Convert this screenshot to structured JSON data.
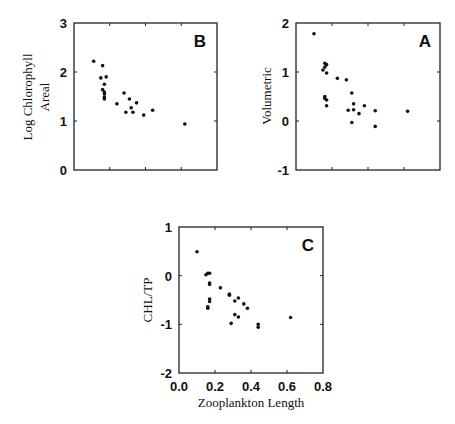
{
  "chart_data": [
    {
      "type": "scatter",
      "panel_label": "B",
      "title": "",
      "xlabel": "",
      "ylabel": "Log Chlorophyll Areal",
      "ylabel_lines": [
        "Log Chlorophyll",
        "Areal"
      ],
      "xlim": [
        0,
        0.8
      ],
      "ylim": [
        0,
        3
      ],
      "xticks": [
        0.0,
        0.2,
        0.4,
        0.6,
        0.8
      ],
      "xtick_labels_shown": false,
      "yticks": [
        0,
        1,
        2,
        3
      ],
      "ytick_labels": [
        "0",
        "1",
        "2",
        "3"
      ],
      "grid": false,
      "points": [
        {
          "x": 0.11,
          "y": 2.22
        },
        {
          "x": 0.16,
          "y": 2.13
        },
        {
          "x": 0.15,
          "y": 1.88
        },
        {
          "x": 0.18,
          "y": 1.9
        },
        {
          "x": 0.17,
          "y": 1.75
        },
        {
          "x": 0.16,
          "y": 1.64
        },
        {
          "x": 0.17,
          "y": 1.59
        },
        {
          "x": 0.17,
          "y": 1.55
        },
        {
          "x": 0.17,
          "y": 1.49
        },
        {
          "x": 0.17,
          "y": 1.45
        },
        {
          "x": 0.24,
          "y": 1.35
        },
        {
          "x": 0.28,
          "y": 1.57
        },
        {
          "x": 0.31,
          "y": 1.45
        },
        {
          "x": 0.35,
          "y": 1.37
        },
        {
          "x": 0.29,
          "y": 1.18
        },
        {
          "x": 0.32,
          "y": 1.27
        },
        {
          "x": 0.33,
          "y": 1.18
        },
        {
          "x": 0.39,
          "y": 1.12
        },
        {
          "x": 0.44,
          "y": 1.22
        },
        {
          "x": 0.62,
          "y": 0.94
        }
      ]
    },
    {
      "type": "scatter",
      "panel_label": "A",
      "title": "",
      "xlabel": "",
      "ylabel": "Volumetric",
      "ylabel_lines": [
        "Volumetric"
      ],
      "xlim": [
        0,
        0.8
      ],
      "ylim": [
        -1,
        2
      ],
      "xticks": [
        0.0,
        0.2,
        0.4,
        0.6,
        0.8
      ],
      "xtick_labels_shown": false,
      "yticks": [
        -1,
        0,
        1,
        2
      ],
      "ytick_labels": [
        "-1",
        "0",
        "1",
        "2"
      ],
      "grid": false,
      "points": [
        {
          "x": 0.1,
          "y": 1.78
        },
        {
          "x": 0.16,
          "y": 1.18
        },
        {
          "x": 0.17,
          "y": 1.15
        },
        {
          "x": 0.15,
          "y": 1.04
        },
        {
          "x": 0.17,
          "y": 0.98
        },
        {
          "x": 0.16,
          "y": 1.1
        },
        {
          "x": 0.16,
          "y": 0.5
        },
        {
          "x": 0.16,
          "y": 0.46
        },
        {
          "x": 0.17,
          "y": 0.43
        },
        {
          "x": 0.17,
          "y": 0.31
        },
        {
          "x": 0.23,
          "y": 0.87
        },
        {
          "x": 0.28,
          "y": 0.84
        },
        {
          "x": 0.31,
          "y": 0.57
        },
        {
          "x": 0.32,
          "y": 0.35
        },
        {
          "x": 0.29,
          "y": 0.22
        },
        {
          "x": 0.32,
          "y": 0.23
        },
        {
          "x": 0.35,
          "y": 0.15
        },
        {
          "x": 0.38,
          "y": 0.31
        },
        {
          "x": 0.31,
          "y": -0.03
        },
        {
          "x": 0.44,
          "y": 0.21
        },
        {
          "x": 0.44,
          "y": -0.11
        },
        {
          "x": 0.62,
          "y": 0.2
        }
      ]
    },
    {
      "type": "scatter",
      "panel_label": "C",
      "title": "",
      "xlabel": "Zooplankton Length",
      "ylabel": "CHL/TP",
      "ylabel_lines": [
        "CHL/TP"
      ],
      "xlim": [
        0,
        0.8
      ],
      "ylim": [
        -2,
        1
      ],
      "xticks": [
        0.0,
        0.2,
        0.4,
        0.6,
        0.8
      ],
      "xtick_labels": [
        "0.0",
        "0.2",
        "0.4",
        "0.6",
        "0.8"
      ],
      "xtick_labels_shown": true,
      "yticks": [
        -2,
        -1,
        0,
        1
      ],
      "ytick_labels": [
        "-2",
        "-1",
        "0",
        "1"
      ],
      "grid": false,
      "points": [
        {
          "x": 0.1,
          "y": 0.49
        },
        {
          "x": 0.15,
          "y": 0.02
        },
        {
          "x": 0.16,
          "y": 0.05
        },
        {
          "x": 0.17,
          "y": 0.05
        },
        {
          "x": 0.17,
          "y": -0.15
        },
        {
          "x": 0.17,
          "y": -0.18
        },
        {
          "x": 0.17,
          "y": -0.48
        },
        {
          "x": 0.17,
          "y": -0.53
        },
        {
          "x": 0.16,
          "y": -0.64
        },
        {
          "x": 0.16,
          "y": -0.67
        },
        {
          "x": 0.23,
          "y": -0.25
        },
        {
          "x": 0.28,
          "y": -0.38
        },
        {
          "x": 0.28,
          "y": -0.4
        },
        {
          "x": 0.31,
          "y": -0.52
        },
        {
          "x": 0.33,
          "y": -0.46
        },
        {
          "x": 0.36,
          "y": -0.58
        },
        {
          "x": 0.38,
          "y": -0.67
        },
        {
          "x": 0.31,
          "y": -0.8
        },
        {
          "x": 0.33,
          "y": -0.85
        },
        {
          "x": 0.29,
          "y": -0.98
        },
        {
          "x": 0.44,
          "y": -1.0
        },
        {
          "x": 0.44,
          "y": -1.06
        },
        {
          "x": 0.62,
          "y": -0.86
        }
      ]
    }
  ],
  "panels": {
    "B": {
      "label": "B",
      "ylabel_1": "Log Chlorophyll",
      "ylabel_2": "Areal"
    },
    "A": {
      "label": "A",
      "ylabel_1": "Volumetric"
    },
    "C": {
      "label": "C",
      "ylabel_1": "CHL/TP",
      "xlabel": "Zooplankton Length"
    }
  }
}
